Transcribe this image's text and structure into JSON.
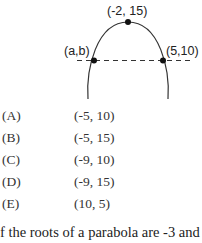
{
  "figure": {
    "vertex_label": "(-2, 15)",
    "left_point_label": "(a,b)",
    "right_point_label": "(5,10)"
  },
  "choices": [
    {
      "letter": "(A)",
      "value": "(-5, 10)"
    },
    {
      "letter": "(B)",
      "value": "(-5, 15)"
    },
    {
      "letter": "(C)",
      "value": "(-9, 10)"
    },
    {
      "letter": "(D)",
      "value": "(-9, 15)"
    },
    {
      "letter": "(E)",
      "value": "(10, 5)"
    }
  ],
  "next_question_text": "f the roots of a parabola are -3 and"
}
